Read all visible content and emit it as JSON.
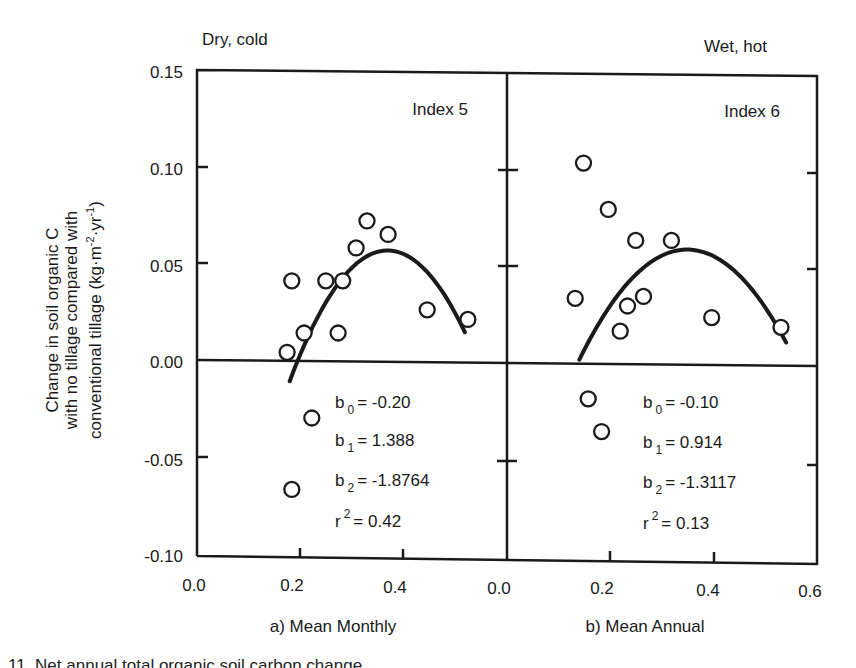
{
  "corner_labels": {
    "left": "Dry, cold",
    "right": "Wet, hot"
  },
  "y_axis": {
    "line1": "Change in soil organic C",
    "line2": "with no tillage compared with",
    "line3_prefix": "conventional tillage (kg·m",
    "line3_sup1": "-2",
    "line3_mid": "·yr",
    "line3_sup2": "-1",
    "line3_suffix": ")",
    "ticks": [
      "0.15",
      "0.10",
      "0.05",
      "0.00",
      "-0.05",
      "-0.10"
    ]
  },
  "panels": [
    {
      "index_label": "Index 5",
      "subtitle": "a) Mean Monthly",
      "x_ticks": [
        "0.0",
        "0.2",
        "0.4"
      ],
      "stats": {
        "b0": "= -0.20",
        "b1": "= 1.388",
        "b2": "= -1.8764",
        "r2": "= 0.42"
      }
    },
    {
      "index_label": "Index 6",
      "subtitle": "b) Mean Annual",
      "x_ticks": [
        "0.0",
        "0.2",
        "0.4",
        "0.6"
      ],
      "stats": {
        "b0": "= -0.10",
        "b1": "= 0.914",
        "b2": "= -1.3117",
        "r2": "= 0.13"
      }
    }
  ],
  "caption_fragment": "11.   Net annual total organic soil carbon change ...",
  "chart_data": [
    {
      "type": "scatter",
      "title": "Index 5",
      "subtitle": "a) Mean Monthly",
      "corner_label": "Dry, cold",
      "xlabel": "a) Mean Monthly",
      "ylabel": "Change in soil organic C with no tillage compared with conventional tillage (kg·m-2·yr-1)",
      "xlim": [
        0.0,
        0.6
      ],
      "ylim": [
        -0.1,
        0.15
      ],
      "x_ticks": [
        0.0,
        0.2,
        0.4
      ],
      "y_ticks": [
        -0.1,
        -0.05,
        0.0,
        0.05,
        0.1,
        0.15
      ],
      "grid": false,
      "points": [
        {
          "x": 0.175,
          "y": 0.004
        },
        {
          "x": 0.184,
          "y": 0.041
        },
        {
          "x": 0.208,
          "y": 0.014
        },
        {
          "x": 0.25,
          "y": 0.041
        },
        {
          "x": 0.283,
          "y": 0.041
        },
        {
          "x": 0.274,
          "y": 0.014
        },
        {
          "x": 0.309,
          "y": 0.058
        },
        {
          "x": 0.33,
          "y": 0.072
        },
        {
          "x": 0.371,
          "y": 0.065
        },
        {
          "x": 0.447,
          "y": 0.026
        },
        {
          "x": 0.526,
          "y": 0.021
        },
        {
          "x": 0.223,
          "y": -0.03
        },
        {
          "x": 0.184,
          "y": -0.067
        }
      ],
      "fit": {
        "type": "quadratic",
        "b0": -0.2,
        "b1": 1.388,
        "b2": -1.8764,
        "r2": 0.42,
        "x_range": [
          0.18,
          0.52
        ]
      }
    },
    {
      "type": "scatter",
      "title": "Index 6",
      "subtitle": "b) Mean Annual",
      "corner_label": "Wet, hot",
      "xlabel": "b) Mean Annual",
      "ylabel": "Change in soil organic C with no tillage compared with conventional tillage (kg·m-2·yr-1)",
      "xlim": [
        0.0,
        0.6
      ],
      "ylim": [
        -0.1,
        0.15
      ],
      "x_ticks": [
        0.0,
        0.2,
        0.4,
        0.6
      ],
      "y_ticks": [
        -0.1,
        -0.05,
        0.0,
        0.05,
        0.1,
        0.15
      ],
      "grid": false,
      "points": [
        {
          "x": 0.148,
          "y": 0.104
        },
        {
          "x": 0.196,
          "y": 0.08
        },
        {
          "x": 0.249,
          "y": 0.064
        },
        {
          "x": 0.318,
          "y": 0.064
        },
        {
          "x": 0.132,
          "y": 0.034
        },
        {
          "x": 0.233,
          "y": 0.03
        },
        {
          "x": 0.264,
          "y": 0.035
        },
        {
          "x": 0.219,
          "y": 0.017
        },
        {
          "x": 0.396,
          "y": 0.024
        },
        {
          "x": 0.53,
          "y": 0.019
        },
        {
          "x": 0.157,
          "y": -0.018
        },
        {
          "x": 0.183,
          "y": -0.035
        }
      ],
      "fit": {
        "type": "quadratic",
        "b0": -0.1,
        "b1": 0.914,
        "b2": -1.3117,
        "r2": 0.13,
        "x_range": [
          0.14,
          0.54
        ]
      }
    }
  ]
}
